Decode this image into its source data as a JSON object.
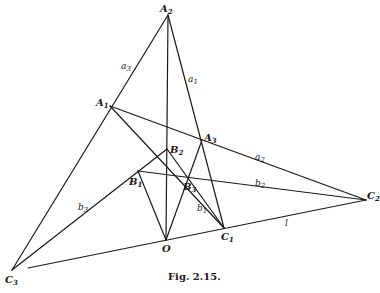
{
  "figure": {
    "caption": "Fig. 2.15.",
    "points": {
      "A2": {
        "base": "A",
        "sub": "2",
        "x": 168,
        "y": 15
      },
      "A1": {
        "base": "A",
        "sub": "1",
        "x": 110,
        "y": 106
      },
      "A3": {
        "base": "A",
        "sub": "3",
        "x": 202,
        "y": 140
      },
      "B2": {
        "base": "B",
        "sub": "2",
        "x": 167,
        "y": 149
      },
      "B1": {
        "base": "B",
        "sub": "1",
        "x": 138,
        "y": 171
      },
      "B3": {
        "base": "B",
        "sub": "3",
        "x": 187,
        "y": 177
      },
      "O": {
        "base": "O",
        "sub": "",
        "x": 166,
        "y": 240
      },
      "C1": {
        "base": "C",
        "sub": "1",
        "x": 224,
        "y": 228
      },
      "C2": {
        "base": "C",
        "sub": "2",
        "x": 366,
        "y": 200
      },
      "C3": {
        "base": "C",
        "sub": "3",
        "x": 12,
        "y": 270
      }
    },
    "line_labels": {
      "a3": {
        "base": "a",
        "sub": "3"
      },
      "a1": {
        "base": "a",
        "sub": "1"
      },
      "a2": {
        "base": "a",
        "sub": "2"
      },
      "b1": {
        "base": "b",
        "sub": "1"
      },
      "b2": {
        "base": "b",
        "sub": "2"
      },
      "b3": {
        "base": "b",
        "sub": "3"
      },
      "l": {
        "base": "l",
        "sub": ""
      }
    }
  }
}
